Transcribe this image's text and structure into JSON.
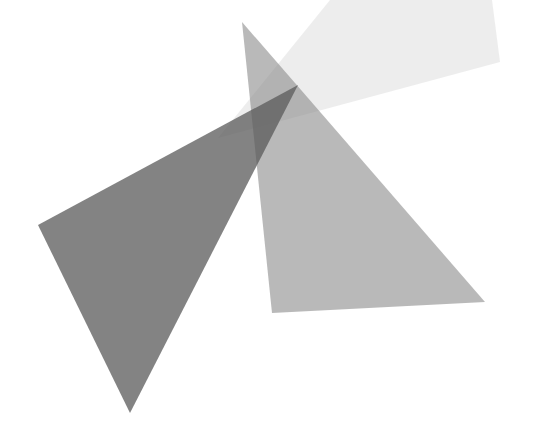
{
  "canvas": {
    "width": 534,
    "height": 429,
    "background": "#ffffff"
  },
  "shapes": [
    {
      "name": "light-quadrilateral",
      "points": "330,0 492,0 500,62 218,138",
      "fill": "#d8d8d8",
      "opacity": 0.45
    },
    {
      "name": "medium-triangle",
      "points": "242,22 272,313 485,302",
      "fill": "#8a8a8a",
      "opacity": 0.6
    },
    {
      "name": "dark-triangle",
      "points": "38,225 130,413 298,85",
      "fill": "#5a5a5a",
      "opacity": 0.75
    }
  ]
}
